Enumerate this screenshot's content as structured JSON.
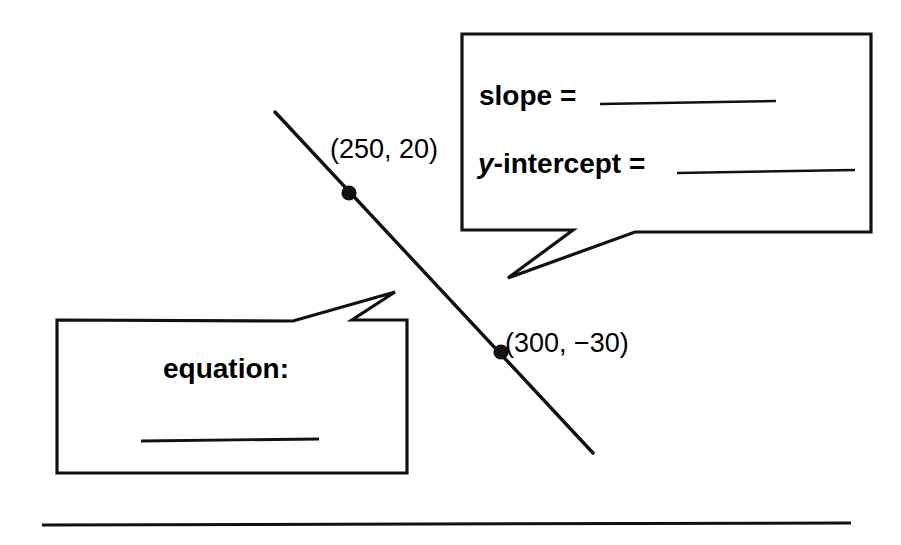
{
  "page": {
    "kind": "math-worksheet-linear-equation",
    "background_color": "#ffffff",
    "ink_color": "#000000",
    "width": 901,
    "height": 545
  },
  "line_graph": {
    "name": "diagonal-line",
    "start": {
      "x": 275,
      "y": 112
    },
    "end": {
      "x": 593,
      "y": 453
    },
    "stroke_width": 3.4,
    "points": [
      {
        "id": "point-1",
        "label": "(250, 20)",
        "x_value": 250,
        "y_value": 20,
        "dot": {
          "cx": 349,
          "cy": 193,
          "r": 7.5
        },
        "label_pos": {
          "x": 330,
          "y": 136
        }
      },
      {
        "id": "point-2",
        "label": "(300, −30)",
        "x_value": 300,
        "y_value": -30,
        "dot": {
          "cx": 501,
          "cy": 352,
          "r": 7.5
        },
        "label_pos": {
          "x": 505,
          "y": 330
        }
      }
    ]
  },
  "bubbles": [
    {
      "id": "slope-intercept-bubble",
      "rect": {
        "x": 462,
        "y": 34,
        "w": 409,
        "h": 198
      },
      "tail": "points down-left toward the line",
      "rows": [
        {
          "id": "slope-row",
          "label_prefix": "",
          "label": "slope = ",
          "answer_value": "",
          "blank_width": 176
        },
        {
          "id": "y-intercept-row",
          "label_prefix": "y",
          "label": "-intercept = ",
          "answer_value": "",
          "blank_width": 178
        }
      ]
    },
    {
      "id": "equation-bubble",
      "rect": {
        "x": 57,
        "y": 320,
        "w": 350,
        "h": 153
      },
      "tail": "points up-right toward the line",
      "heading": "equation:",
      "answer_value": "",
      "blank_width": 177
    }
  ],
  "footer_rule": {
    "name": "horizontal-rule",
    "x1": 42,
    "y1": 525,
    "x2": 851,
    "y2": 523,
    "stroke_width": 3
  }
}
